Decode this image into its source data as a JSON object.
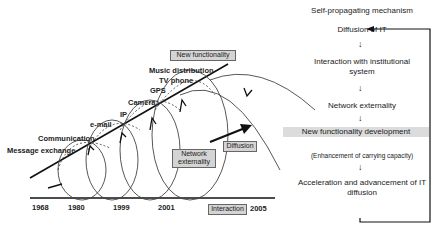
{
  "left_diagram": {
    "milestones": [
      "Message exchange",
      "Communication",
      "e-mail",
      "IP",
      "Camera",
      "GPS",
      "TV phone",
      "Music distribution"
    ],
    "boxes": {
      "new_functionality": "New functionality",
      "network_externality_line1": "Network",
      "network_externality_line2": "externality",
      "diffusion": "Diffusion",
      "interaction": "Interaction"
    },
    "years": [
      "1968",
      "1980",
      "1999",
      "2001",
      "2005"
    ]
  },
  "right_flow": {
    "title": "Self-propagating mechanism",
    "steps": [
      "Diffusion of IT",
      "Interaction with institutional system",
      "Network externality",
      "New functionality development",
      "(Enhancement of carrying capacity)",
      "Acceleration and advancement of IT diffusion"
    ],
    "arrow_glyph": "↓"
  },
  "colors": {
    "box_fill": "#d4d4d4",
    "line": "#111111"
  }
}
